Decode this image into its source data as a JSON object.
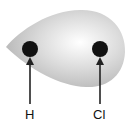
{
  "diagram": {
    "atoms": [
      {
        "symbol": "H",
        "cx": 30,
        "cy": 49
      },
      {
        "symbol": "Cl",
        "cx": 100,
        "cy": 49
      }
    ],
    "labels": {
      "left": "H",
      "right": "Cl"
    },
    "colors": {
      "cloud": "#c8c8c8",
      "nucleus": "#111111",
      "arrow": "#222222"
    }
  }
}
